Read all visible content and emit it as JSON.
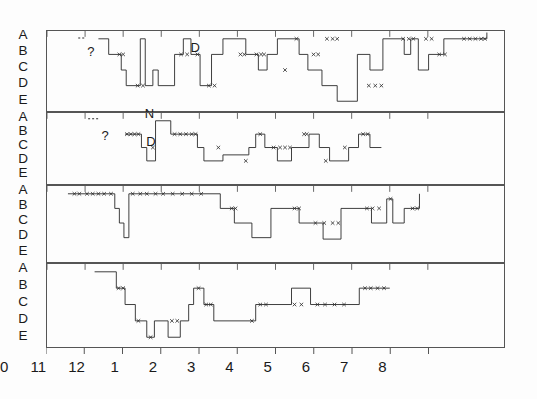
{
  "chart_data": {
    "type": "line",
    "title": "",
    "subtitle": "",
    "xlabel": "",
    "ylabel": "",
    "grid": false,
    "legend_position": "none",
    "xlim": [
      10,
      22
    ],
    "xtick_values": [
      10,
      11,
      12,
      13,
      14,
      15,
      16,
      17,
      18,
      19,
      20
    ],
    "xtick_labels": [
      "10",
      "11",
      "12",
      "1",
      "2",
      "3",
      "4",
      "5",
      "6",
      "7",
      "8"
    ],
    "ytick_labels": [
      "A",
      "B",
      "C",
      "D",
      "E"
    ],
    "ylim": [
      0,
      4
    ],
    "panel_count": 4,
    "marker_symbol": "x",
    "series": [
      {
        "name": "night-1",
        "panel": 0,
        "points": [
          [
            11.35,
            0
          ],
          [
            11.62,
            0
          ],
          [
            11.62,
            1
          ],
          [
            11.95,
            1
          ],
          [
            11.95,
            2
          ],
          [
            12.08,
            2
          ],
          [
            12.08,
            3
          ],
          [
            12.45,
            3
          ],
          [
            12.45,
            0
          ],
          [
            12.58,
            0
          ],
          [
            12.58,
            3
          ],
          [
            12.78,
            3
          ],
          [
            12.78,
            2
          ],
          [
            12.92,
            2
          ],
          [
            12.92,
            3
          ],
          [
            13.35,
            3
          ],
          [
            13.35,
            1
          ],
          [
            13.58,
            1
          ],
          [
            13.58,
            0
          ],
          [
            13.78,
            0
          ],
          [
            13.78,
            1
          ],
          [
            14.02,
            1
          ],
          [
            14.02,
            3
          ],
          [
            14.32,
            3
          ],
          [
            14.32,
            1
          ],
          [
            14.62,
            1
          ],
          [
            14.62,
            0
          ],
          [
            15.22,
            0
          ],
          [
            15.22,
            1
          ],
          [
            15.55,
            1
          ],
          [
            15.55,
            2
          ],
          [
            15.78,
            2
          ],
          [
            15.78,
            1
          ],
          [
            16.05,
            1
          ],
          [
            16.05,
            0
          ],
          [
            16.62,
            0
          ],
          [
            16.62,
            1
          ],
          [
            16.85,
            1
          ],
          [
            16.85,
            2
          ],
          [
            17.22,
            2
          ],
          [
            17.22,
            3
          ],
          [
            17.62,
            3
          ],
          [
            17.62,
            4
          ],
          [
            18.15,
            4
          ],
          [
            18.15,
            1
          ],
          [
            18.48,
            1
          ],
          [
            18.48,
            2
          ],
          [
            18.82,
            2
          ],
          [
            18.82,
            0
          ],
          [
            19.38,
            0
          ],
          [
            19.38,
            1
          ],
          [
            19.55,
            1
          ],
          [
            19.55,
            0
          ],
          [
            19.75,
            0
          ],
          [
            19.75,
            2
          ],
          [
            20.02,
            2
          ],
          [
            20.02,
            1
          ],
          [
            20.42,
            1
          ],
          [
            20.42,
            0
          ],
          [
            21.55,
            0
          ],
          [
            21.55,
            -0.4
          ]
        ],
        "markers": [
          [
            11.9,
            1
          ],
          [
            12.0,
            1
          ],
          [
            12.38,
            3
          ],
          [
            12.52,
            3
          ],
          [
            13.52,
            1
          ],
          [
            13.68,
            1
          ],
          [
            13.95,
            1
          ],
          [
            14.25,
            3
          ],
          [
            14.4,
            3
          ],
          [
            15.08,
            1
          ],
          [
            15.18,
            1
          ],
          [
            15.5,
            1
          ],
          [
            15.62,
            1
          ],
          [
            15.7,
            1
          ],
          [
            16.25,
            2
          ],
          [
            16.55,
            0
          ],
          [
            17.0,
            1
          ],
          [
            17.12,
            1
          ],
          [
            17.35,
            0
          ],
          [
            17.5,
            0
          ],
          [
            17.62,
            0
          ],
          [
            18.45,
            3
          ],
          [
            18.62,
            3
          ],
          [
            18.78,
            3
          ],
          [
            19.35,
            0
          ],
          [
            19.5,
            0
          ],
          [
            19.62,
            0
          ],
          [
            19.95,
            0
          ],
          [
            20.1,
            0
          ],
          [
            20.3,
            1
          ],
          [
            20.45,
            1
          ],
          [
            20.95,
            0
          ],
          [
            21.1,
            0
          ],
          [
            21.25,
            0
          ],
          [
            21.4,
            0
          ],
          [
            21.5,
            0
          ]
        ]
      },
      {
        "name": "night-2",
        "panel": 1,
        "points": [
          [
            12.05,
            1
          ],
          [
            12.48,
            1
          ],
          [
            12.48,
            2
          ],
          [
            12.62,
            2
          ],
          [
            12.62,
            3
          ],
          [
            12.85,
            3
          ],
          [
            12.85,
            0
          ],
          [
            13.25,
            0
          ],
          [
            13.25,
            1
          ],
          [
            13.95,
            1
          ],
          [
            13.95,
            2
          ],
          [
            14.12,
            2
          ],
          [
            14.12,
            3
          ],
          [
            14.62,
            3
          ],
          [
            14.62,
            2.55
          ],
          [
            15.3,
            2.55
          ],
          [
            15.3,
            2
          ],
          [
            15.48,
            2
          ],
          [
            15.48,
            1
          ],
          [
            15.72,
            1
          ],
          [
            15.72,
            2
          ],
          [
            16.05,
            2
          ],
          [
            16.05,
            3
          ],
          [
            16.42,
            3
          ],
          [
            16.42,
            2
          ],
          [
            16.88,
            2
          ],
          [
            16.88,
            1
          ],
          [
            17.15,
            1
          ],
          [
            17.15,
            2
          ],
          [
            17.42,
            2
          ],
          [
            17.42,
            3
          ],
          [
            17.92,
            3
          ],
          [
            17.92,
            2
          ],
          [
            18.18,
            2
          ],
          [
            18.18,
            1
          ],
          [
            18.48,
            1
          ],
          [
            18.48,
            2
          ],
          [
            18.78,
            2
          ]
        ],
        "markers": [
          [
            12.1,
            1
          ],
          [
            12.2,
            1
          ],
          [
            12.3,
            1
          ],
          [
            12.4,
            1
          ],
          [
            12.78,
            2
          ],
          [
            13.35,
            1
          ],
          [
            13.5,
            1
          ],
          [
            13.65,
            1
          ],
          [
            13.8,
            1
          ],
          [
            13.9,
            1
          ],
          [
            14.5,
            2
          ],
          [
            15.22,
            3
          ],
          [
            15.6,
            1
          ],
          [
            15.95,
            2
          ],
          [
            16.12,
            2
          ],
          [
            16.25,
            2
          ],
          [
            16.38,
            2
          ],
          [
            16.75,
            1
          ],
          [
            16.82,
            1
          ],
          [
            17.32,
            3
          ],
          [
            17.82,
            2
          ],
          [
            18.3,
            1
          ],
          [
            18.42,
            1
          ]
        ]
      },
      {
        "name": "night-3",
        "panel": 2,
        "points": [
          [
            10.55,
            0
          ],
          [
            11.78,
            0
          ],
          [
            11.78,
            1
          ],
          [
            11.9,
            1
          ],
          [
            11.9,
            2
          ],
          [
            12.02,
            2
          ],
          [
            12.02,
            3
          ],
          [
            12.15,
            3
          ],
          [
            12.15,
            0
          ],
          [
            14.55,
            0
          ],
          [
            14.55,
            1
          ],
          [
            14.92,
            1
          ],
          [
            14.92,
            2
          ],
          [
            15.38,
            2
          ],
          [
            15.38,
            3
          ],
          [
            15.88,
            3
          ],
          [
            15.88,
            1
          ],
          [
            16.62,
            1
          ],
          [
            16.62,
            2
          ],
          [
            17.25,
            2
          ],
          [
            17.25,
            3.1
          ],
          [
            17.72,
            3.1
          ],
          [
            17.72,
            1
          ],
          [
            18.52,
            1
          ],
          [
            18.52,
            2
          ],
          [
            18.92,
            2
          ],
          [
            18.92,
            0.35
          ],
          [
            19.08,
            0.35
          ],
          [
            19.08,
            2
          ],
          [
            19.38,
            2
          ],
          [
            19.38,
            1
          ],
          [
            19.78,
            1
          ],
          [
            19.78,
            0
          ]
        ],
        "markers": [
          [
            10.72,
            0
          ],
          [
            10.85,
            0
          ],
          [
            11.05,
            0
          ],
          [
            11.2,
            0
          ],
          [
            11.35,
            0
          ],
          [
            11.5,
            0
          ],
          [
            11.68,
            0
          ],
          [
            12.25,
            0
          ],
          [
            12.45,
            0
          ],
          [
            12.62,
            0
          ],
          [
            12.85,
            0
          ],
          [
            13.05,
            0
          ],
          [
            13.3,
            0
          ],
          [
            13.55,
            0
          ],
          [
            13.8,
            0
          ],
          [
            14.05,
            0
          ],
          [
            14.85,
            1
          ],
          [
            14.95,
            1
          ],
          [
            16.5,
            1
          ],
          [
            16.62,
            1
          ],
          [
            17.05,
            2
          ],
          [
            17.28,
            2
          ],
          [
            17.5,
            2
          ],
          [
            17.65,
            2
          ],
          [
            18.4,
            1
          ],
          [
            18.55,
            1
          ],
          [
            18.72,
            1
          ],
          [
            19.02,
            0.35
          ],
          [
            19.6,
            1
          ],
          [
            19.72,
            1
          ]
        ]
      },
      {
        "name": "night-4",
        "panel": 3,
        "points": [
          [
            11.25,
            0
          ],
          [
            11.82,
            0
          ],
          [
            11.82,
            1
          ],
          [
            12.05,
            1
          ],
          [
            12.05,
            2
          ],
          [
            12.32,
            2
          ],
          [
            12.32,
            3
          ],
          [
            12.62,
            3
          ],
          [
            12.62,
            4
          ],
          [
            12.82,
            4
          ],
          [
            12.82,
            3
          ],
          [
            13.18,
            3
          ],
          [
            13.18,
            4
          ],
          [
            13.5,
            4
          ],
          [
            13.5,
            3
          ],
          [
            13.72,
            3
          ],
          [
            13.72,
            2
          ],
          [
            13.85,
            2
          ],
          [
            13.85,
            1
          ],
          [
            14.12,
            1
          ],
          [
            14.12,
            2
          ],
          [
            14.38,
            2
          ],
          [
            14.38,
            3
          ],
          [
            15.48,
            3
          ],
          [
            15.48,
            2
          ],
          [
            16.42,
            2
          ],
          [
            16.42,
            1
          ],
          [
            16.92,
            1
          ],
          [
            16.92,
            2
          ],
          [
            18.2,
            2
          ],
          [
            18.2,
            1
          ],
          [
            19.0,
            1
          ]
        ],
        "markers": [
          [
            11.88,
            1
          ],
          [
            12.0,
            1
          ],
          [
            12.4,
            3
          ],
          [
            12.72,
            4
          ],
          [
            13.28,
            3
          ],
          [
            13.42,
            3
          ],
          [
            13.98,
            1
          ],
          [
            14.18,
            2
          ],
          [
            14.3,
            2
          ],
          [
            15.38,
            3
          ],
          [
            15.6,
            2
          ],
          [
            15.75,
            2
          ],
          [
            16.5,
            2
          ],
          [
            16.68,
            2
          ],
          [
            17.1,
            2
          ],
          [
            17.3,
            2
          ],
          [
            17.55,
            2
          ],
          [
            17.8,
            2
          ],
          [
            18.35,
            1
          ],
          [
            18.5,
            1
          ],
          [
            18.68,
            1
          ],
          [
            18.85,
            1
          ]
        ]
      }
    ],
    "annotations": [
      {
        "text": "?",
        "panel": 0,
        "x": 11.08,
        "stage": 0.35
      },
      {
        "text": "N",
        "panel": 0,
        "x": 12.58,
        "stage": 4.25
      },
      {
        "text": "D",
        "panel": 0,
        "x": 13.78,
        "stage": 0.1
      },
      {
        "text": "?",
        "panel": 1,
        "x": 11.45,
        "stage": 0.55
      },
      {
        "text": "D",
        "panel": 1,
        "x": 12.62,
        "stage": 1.05
      }
    ],
    "dashed_segments": [
      {
        "panel": 0,
        "x0": 10.82,
        "x1": 11.0,
        "stage": -0.05
      },
      {
        "panel": 1,
        "x0": 11.08,
        "x1": 11.35,
        "stage": -0.15
      }
    ]
  },
  "axis": {
    "tick_labels": [
      "10",
      "11",
      "12",
      "1",
      "2",
      "3",
      "4",
      "5",
      "6",
      "7",
      "8"
    ]
  },
  "panels": [
    {
      "id": "panel-1",
      "ylabels": [
        "A",
        "B",
        "C",
        "D",
        "E"
      ]
    },
    {
      "id": "panel-2",
      "ylabels": [
        "A",
        "B",
        "C",
        "D",
        "E"
      ]
    },
    {
      "id": "panel-3",
      "ylabels": [
        "A",
        "B",
        "C",
        "D",
        "E"
      ]
    },
    {
      "id": "panel-4",
      "ylabels": [
        "A",
        "B",
        "C",
        "D",
        "E"
      ]
    }
  ],
  "colors": {
    "line": "#2a2a2a",
    "frame": "#555555",
    "text": "#1a1a1a",
    "background": "#fdfdfd"
  }
}
